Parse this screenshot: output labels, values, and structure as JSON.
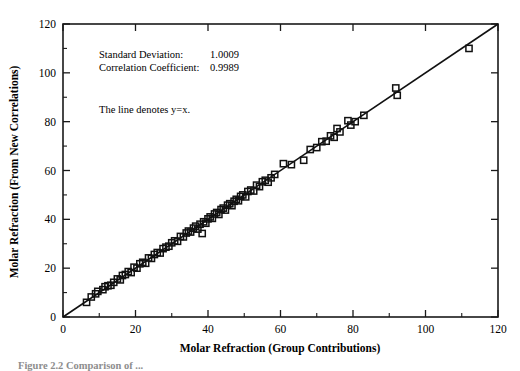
{
  "figure": {
    "caption_fragment": "Figure 2.2   Comparison of ...",
    "background_color": "#ffffff",
    "ink_color": "#111111"
  },
  "annotations": {
    "std_dev_label": "Standard Deviation:",
    "std_dev_value": "1.0009",
    "corr_coef_label": "Correlation Coefficient:",
    "corr_coef_value": "0.9989",
    "line_note": "The line denotes y=x."
  },
  "chart_data": {
    "type": "scatter",
    "title": "",
    "xlabel": "Molar Refraction (Group Contributions)",
    "ylabel": "Molar Refraction (From New Correlations)",
    "xlim": [
      0,
      120
    ],
    "ylim": [
      0,
      120
    ],
    "xticks": [
      0,
      20,
      40,
      60,
      80,
      100,
      120
    ],
    "yticks": [
      0,
      20,
      40,
      60,
      80,
      100,
      120
    ],
    "xtick_labels": [
      "0",
      "20",
      "40",
      "60",
      "80",
      "100",
      "120"
    ],
    "ytick_labels": [
      "0",
      "20",
      "40",
      "60",
      "80",
      "100",
      "120"
    ],
    "minor_tick_step": 10,
    "grid": false,
    "legend": null,
    "marker": "open-square",
    "reference_line": {
      "label": "y=x",
      "x": [
        0,
        120
      ],
      "y": [
        0,
        120
      ]
    },
    "series": [
      {
        "name": "Molar Refraction",
        "points": [
          [
            6.5,
            6.0
          ],
          [
            7.8,
            8.2
          ],
          [
            9.0,
            9.5
          ],
          [
            9.6,
            10.5
          ],
          [
            11.0,
            11.2
          ],
          [
            11.6,
            12.4
          ],
          [
            12.4,
            12.8
          ],
          [
            13.2,
            13.0
          ],
          [
            14.0,
            14.2
          ],
          [
            15.0,
            15.6
          ],
          [
            15.8,
            15.2
          ],
          [
            16.4,
            17.0
          ],
          [
            17.2,
            17.4
          ],
          [
            18.0,
            18.6
          ],
          [
            18.8,
            18.2
          ],
          [
            19.6,
            20.4
          ],
          [
            20.4,
            20.0
          ],
          [
            21.2,
            21.8
          ],
          [
            22.0,
            22.4
          ],
          [
            22.8,
            22.0
          ],
          [
            23.6,
            24.2
          ],
          [
            24.4,
            24.0
          ],
          [
            25.2,
            25.6
          ],
          [
            26.0,
            26.4
          ],
          [
            26.8,
            26.2
          ],
          [
            27.6,
            28.0
          ],
          [
            28.4,
            28.6
          ],
          [
            29.2,
            29.0
          ],
          [
            30.0,
            30.4
          ],
          [
            30.8,
            31.2
          ],
          [
            31.6,
            31.0
          ],
          [
            32.4,
            33.0
          ],
          [
            33.2,
            32.8
          ],
          [
            34.0,
            34.4
          ],
          [
            34.6,
            35.2
          ],
          [
            35.2,
            34.8
          ],
          [
            36.0,
            36.4
          ],
          [
            36.6,
            37.2
          ],
          [
            37.2,
            36.0
          ],
          [
            37.8,
            38.0
          ],
          [
            38.4,
            34.2
          ],
          [
            38.8,
            39.0
          ],
          [
            39.4,
            38.4
          ],
          [
            40.0,
            40.2
          ],
          [
            40.6,
            41.0
          ],
          [
            41.2,
            40.4
          ],
          [
            41.8,
            42.2
          ],
          [
            42.4,
            42.8
          ],
          [
            43.0,
            42.0
          ],
          [
            43.6,
            44.0
          ],
          [
            44.2,
            44.6
          ],
          [
            44.8,
            43.8
          ],
          [
            45.4,
            45.8
          ],
          [
            46.0,
            46.4
          ],
          [
            46.6,
            45.6
          ],
          [
            47.2,
            47.4
          ],
          [
            47.8,
            48.2
          ],
          [
            48.4,
            47.6
          ],
          [
            49.0,
            49.4
          ],
          [
            49.6,
            50.0
          ],
          [
            50.4,
            49.2
          ],
          [
            51.0,
            51.4
          ],
          [
            51.8,
            52.0
          ],
          [
            52.6,
            51.6
          ],
          [
            53.4,
            54.0
          ],
          [
            54.2,
            53.4
          ],
          [
            55.0,
            55.4
          ],
          [
            55.8,
            56.0
          ],
          [
            56.6,
            55.2
          ],
          [
            57.4,
            57.0
          ],
          [
            58.4,
            58.4
          ],
          [
            60.8,
            62.8
          ],
          [
            63.0,
            62.4
          ],
          [
            66.4,
            64.2
          ],
          [
            68.2,
            68.6
          ],
          [
            70.0,
            69.4
          ],
          [
            71.4,
            71.8
          ],
          [
            72.6,
            72.0
          ],
          [
            73.8,
            74.2
          ],
          [
            74.8,
            73.6
          ],
          [
            75.6,
            77.2
          ],
          [
            76.4,
            75.8
          ],
          [
            78.6,
            80.4
          ],
          [
            79.4,
            78.6
          ],
          [
            80.6,
            80.0
          ],
          [
            83.0,
            82.6
          ],
          [
            91.8,
            93.8
          ],
          [
            92.2,
            90.8
          ],
          [
            112.0,
            110.0
          ]
        ]
      }
    ]
  },
  "axes_geometry": {
    "left_px": 63,
    "right_px": 498,
    "top_px": 24,
    "bottom_px": 317
  }
}
